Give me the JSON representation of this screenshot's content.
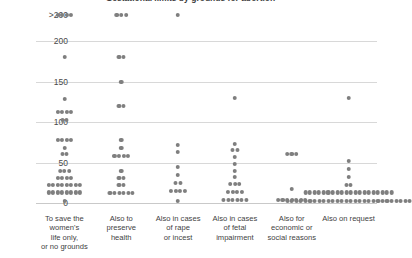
{
  "chart_data": {
    "type": "scatter",
    "title": "Gestational limits by grounds for abortion",
    "xlabel": "",
    "ylabel": "",
    "ylim": [
      0,
      200
    ],
    "grid": true,
    "legend": "none",
    "dot_color": "#7f7f7f",
    "y_ticks": [
      {
        "label": ">200",
        "value": 215
      },
      {
        "label": "200",
        "value": 200
      },
      {
        "label": "150",
        "value": 150
      },
      {
        "label": "100",
        "value": 100
      },
      {
        "label": "50",
        "value": 50
      },
      {
        "label": "0",
        "value": 0
      }
    ],
    "categories": [
      "To save the women's life only, or no grounds",
      "Also to preserve health",
      "Also in cases of rape or incest",
      "Also in cases of fetal impairment",
      "Also for economic or social reasons",
      "Also on request"
    ],
    "category_lines": [
      [
        "To save the",
        "women's",
        "life only,",
        "or no grounds"
      ],
      [
        "Also to",
        "preserve",
        "health"
      ],
      [
        "Also in cases",
        "of rape",
        "or incest"
      ],
      [
        "Also in cases",
        "of fetal",
        "impairment"
      ],
      [
        "Also for",
        "economic or",
        "social reasons"
      ],
      [
        "Also on request"
      ]
    ],
    "series": [
      {
        "name": "To save the women's life only, or no grounds",
        "stacks": [
          {
            "value": 215,
            "count": 4
          },
          {
            "value": 180,
            "count": 1
          },
          {
            "value": 128,
            "count": 1
          },
          {
            "value": 112,
            "count": 4
          },
          {
            "value": 102,
            "count": 2
          },
          {
            "value": 78,
            "count": 4
          },
          {
            "value": 68,
            "count": 1
          },
          {
            "value": 60,
            "count": 2
          },
          {
            "value": 40,
            "count": 3
          },
          {
            "value": 31,
            "count": 4
          },
          {
            "value": 22,
            "count": 8
          },
          {
            "value": 13,
            "count": 8
          },
          {
            "value": 3,
            "count": 1
          }
        ]
      },
      {
        "name": "Also to preserve health",
        "stacks": [
          {
            "value": 215,
            "count": 3
          },
          {
            "value": 180,
            "count": 2
          },
          {
            "value": 150,
            "count": 1
          },
          {
            "value": 120,
            "count": 2
          },
          {
            "value": 78,
            "count": 1
          },
          {
            "value": 68,
            "count": 1
          },
          {
            "value": 58,
            "count": 4
          },
          {
            "value": 40,
            "count": 1
          },
          {
            "value": 31,
            "count": 2
          },
          {
            "value": 22,
            "count": 2
          },
          {
            "value": 12,
            "count": 6
          }
        ]
      },
      {
        "name": "Also in cases of rape or incest",
        "stacks": [
          {
            "value": 215,
            "count": 1
          },
          {
            "value": 72,
            "count": 1
          },
          {
            "value": 63,
            "count": 1
          },
          {
            "value": 44,
            "count": 1
          },
          {
            "value": 35,
            "count": 1
          },
          {
            "value": 25,
            "count": 2
          },
          {
            "value": 15,
            "count": 4
          },
          {
            "value": 3,
            "count": 1
          }
        ]
      },
      {
        "name": "Also in cases of fetal impairment",
        "stacks": [
          {
            "value": 130,
            "count": 1
          },
          {
            "value": 73,
            "count": 1
          },
          {
            "value": 65,
            "count": 2
          },
          {
            "value": 57,
            "count": 1
          },
          {
            "value": 48,
            "count": 1
          },
          {
            "value": 40,
            "count": 1
          },
          {
            "value": 32,
            "count": 1
          },
          {
            "value": 23,
            "count": 3
          },
          {
            "value": 14,
            "count": 4
          },
          {
            "value": 4,
            "count": 6
          }
        ]
      },
      {
        "name": "Also for economic or social reasons",
        "stacks": [
          {
            "value": 60,
            "count": 3
          },
          {
            "value": 17,
            "count": 1
          },
          {
            "value": 4,
            "count": 7
          }
        ]
      },
      {
        "name": "Also on request",
        "stacks": [
          {
            "value": 130,
            "count": 1
          },
          {
            "value": 52,
            "count": 1
          },
          {
            "value": 42,
            "count": 1
          },
          {
            "value": 32,
            "count": 1
          },
          {
            "value": 22,
            "count": 2
          },
          {
            "value": 13,
            "count": 20
          },
          {
            "value": 3,
            "count": 28
          }
        ]
      }
    ]
  }
}
